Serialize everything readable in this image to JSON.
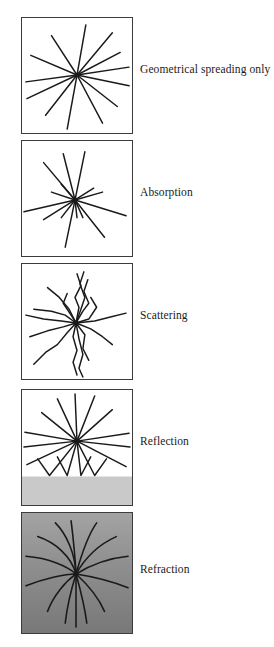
{
  "figure": {
    "title": "",
    "background_color": "#ffffff",
    "line_color": "#1a1a1a",
    "panel_border_color": "#3c3c3c",
    "panels": [
      {
        "id": "geometrical-spreading",
        "label": "Geometrical spreading only",
        "box": {
          "x": 21,
          "y": 17,
          "w": 112,
          "h": 117
        },
        "label_x": 140,
        "label_y": 70,
        "background": "#ffffff",
        "medium": "uniform-white",
        "ray_style": "straight-full-length",
        "ray_count": 12,
        "source": {
          "x": 56,
          "y": 58
        },
        "rays": [
          {
            "angle_deg": -80,
            "length": 52
          },
          {
            "angle_deg": -50,
            "length": 56
          },
          {
            "angle_deg": -28,
            "length": 50
          },
          {
            "angle_deg": -8,
            "length": 54
          },
          {
            "angle_deg": 12,
            "length": 54
          },
          {
            "angle_deg": 38,
            "length": 52
          },
          {
            "angle_deg": 62,
            "length": 56
          },
          {
            "angle_deg": 100,
            "length": 56
          },
          {
            "angle_deg": 128,
            "length": 52
          },
          {
            "angle_deg": 155,
            "length": 56
          },
          {
            "angle_deg": 172,
            "length": 52
          },
          {
            "angle_deg": 208,
            "length": 54
          }
        ]
      },
      {
        "id": "absorption",
        "label": "Absorption",
        "box": {
          "x": 21,
          "y": 140,
          "w": 112,
          "h": 117
        },
        "label_x": 140,
        "label_y": 193,
        "background": "#ffffff",
        "medium": "absorbing-white",
        "ray_style": "straight-variable-length",
        "ray_count": 12,
        "source": {
          "x": 54,
          "y": 60
        },
        "rays": [
          {
            "angle_deg": -78,
            "length": 50
          },
          {
            "angle_deg": -60,
            "length": 28
          },
          {
            "angle_deg": -38,
            "length": 22
          },
          {
            "angle_deg": -16,
            "length": 34
          },
          {
            "angle_deg": 6,
            "length": 46
          },
          {
            "angle_deg": 26,
            "length": 20
          },
          {
            "angle_deg": 48,
            "length": 44
          },
          {
            "angle_deg": 72,
            "length": 18
          },
          {
            "angle_deg": 96,
            "length": 48
          },
          {
            "angle_deg": 126,
            "length": 24
          },
          {
            "angle_deg": 160,
            "length": 50
          },
          {
            "angle_deg": 196,
            "length": 46
          },
          {
            "angle_deg": 222,
            "length": 44
          }
        ]
      },
      {
        "id": "scattering",
        "label": "Scattering",
        "box": {
          "x": 21,
          "y": 263,
          "w": 112,
          "h": 117
        },
        "label_x": 140,
        "label_y": 316,
        "background": "#ffffff",
        "medium": "heterogeneous-white",
        "ray_style": "kinked-zigzag",
        "ray_count": 12,
        "source": {
          "x": 55,
          "y": 60
        },
        "rays": [
          {
            "angle_deg": -84,
            "length": 46,
            "kinks": 3
          },
          {
            "angle_deg": -66,
            "length": 42,
            "kinks": 3
          },
          {
            "angle_deg": -40,
            "length": 18,
            "kinks": 2
          },
          {
            "angle_deg": -12,
            "length": 42,
            "kinks": 2
          },
          {
            "angle_deg": 14,
            "length": 36,
            "kinks": 2
          },
          {
            "angle_deg": 44,
            "length": 32,
            "kinks": 3
          },
          {
            "angle_deg": 76,
            "length": 48,
            "kinks": 4
          },
          {
            "angle_deg": 100,
            "length": 50,
            "kinks": 4
          },
          {
            "angle_deg": 124,
            "length": 44,
            "kinks": 3
          },
          {
            "angle_deg": 158,
            "length": 46,
            "kinks": 3
          },
          {
            "angle_deg": 186,
            "length": 50,
            "kinks": 2
          },
          {
            "angle_deg": 212,
            "length": 46,
            "kinks": 3
          }
        ]
      },
      {
        "id": "reflection",
        "label": "Reflection",
        "box": {
          "x": 21,
          "y": 389,
          "w": 112,
          "h": 117
        },
        "label_x": 140,
        "label_y": 442,
        "background": "#ffffff",
        "medium": "two-layer",
        "interface_y_fraction": 0.75,
        "lower_layer_color": "#c9c9c9",
        "ray_style": "straight-with-reflection",
        "ray_count": 12,
        "source": {
          "x": 56,
          "y": 52
        },
        "upgoing_rays": [
          {
            "angle_deg": -86,
            "length": 52
          },
          {
            "angle_deg": -62,
            "length": 52
          },
          {
            "angle_deg": -38,
            "length": 50
          },
          {
            "angle_deg": -14,
            "length": 54
          },
          {
            "angle_deg": 8,
            "length": 54
          },
          {
            "angle_deg": 172,
            "length": 54
          },
          {
            "angle_deg": 196,
            "length": 54
          },
          {
            "angle_deg": 218,
            "length": 52
          },
          {
            "angle_deg": 242,
            "length": 52
          }
        ],
        "reflected_rays": [
          {
            "down_angle_deg": 108,
            "up_angle_deg": 72
          },
          {
            "down_angle_deg": 92,
            "up_angle_deg": 62
          },
          {
            "down_angle_deg": 72,
            "up_angle_deg": 44
          },
          {
            "down_angle_deg": 126,
            "up_angle_deg": 98
          }
        ]
      },
      {
        "id": "refraction",
        "label": "Refraction",
        "box": {
          "x": 21,
          "y": 512,
          "w": 112,
          "h": 122
        },
        "label_x": 140,
        "label_y": 570,
        "background": "gradient-gray",
        "medium": "velocity-gradient",
        "gradient_top_color": "#9e9e9e",
        "gradient_bottom_color": "#7a7a7a",
        "ray_style": "curved-bending",
        "ray_count": 12,
        "source": {
          "x": 55,
          "y": 62
        },
        "rays": [
          {
            "angle_deg": -88,
            "curvature": 0.3
          },
          {
            "angle_deg": -66,
            "curvature": 0.45
          },
          {
            "angle_deg": -40,
            "curvature": 0.6
          },
          {
            "angle_deg": -12,
            "curvature": 0.7
          },
          {
            "angle_deg": 14,
            "curvature": 0.66
          },
          {
            "angle_deg": 42,
            "curvature": 0.52
          },
          {
            "angle_deg": 70,
            "curvature": 0.34
          },
          {
            "angle_deg": 96,
            "curvature": 0.3
          },
          {
            "angle_deg": 118,
            "curvature": 0.44
          },
          {
            "angle_deg": 146,
            "curvature": 0.58
          },
          {
            "angle_deg": 172,
            "curvature": 0.68
          },
          {
            "angle_deg": 200,
            "curvature": 0.64
          },
          {
            "angle_deg": 228,
            "curvature": 0.5
          }
        ]
      }
    ]
  }
}
